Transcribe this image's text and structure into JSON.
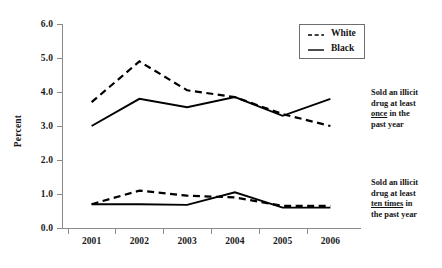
{
  "chart_data": {
    "type": "line",
    "title": "",
    "xlabel": "",
    "ylabel": "Percent",
    "x": [
      "2001",
      "2002",
      "2003",
      "2004",
      "2005",
      "2006"
    ],
    "categories": [
      "2001",
      "2002",
      "2003",
      "2004",
      "2005",
      "2006"
    ],
    "xlim": [
      2000.6,
      2006.4
    ],
    "ylim": [
      0.0,
      6.0
    ],
    "yticks": [
      "0.0",
      "1.0",
      "2.0",
      "3.0",
      "4.0",
      "5.0",
      "6.0"
    ],
    "ytick_values": [
      0.0,
      1.0,
      2.0,
      3.0,
      4.0,
      5.0,
      6.0
    ],
    "grid": false,
    "legend_position": "top-right",
    "legend": [
      {
        "label": "White",
        "style": "dashed"
      },
      {
        "label": "Black",
        "style": "solid"
      }
    ],
    "groups": [
      {
        "name": "Sold an illicit drug at least once in the past year",
        "series": [
          {
            "name": "White",
            "style": "dashed",
            "values": [
              3.7,
              4.9,
              4.05,
              3.85,
              3.35,
              3.0
            ]
          },
          {
            "name": "Black",
            "style": "solid",
            "values": [
              3.0,
              3.8,
              3.55,
              3.85,
              3.3,
              3.8
            ]
          }
        ]
      },
      {
        "name": "Sold an illicit drug at least ten times in the past year",
        "series": [
          {
            "name": "White",
            "style": "dashed",
            "values": [
              0.7,
              1.1,
              0.95,
              0.9,
              0.65,
              0.65
            ]
          },
          {
            "name": "Black",
            "style": "solid",
            "values": [
              0.7,
              0.7,
              0.68,
              1.05,
              0.6,
              0.6
            ]
          }
        ]
      }
    ],
    "series": [
      {
        "name": "White - once in past year",
        "style": "dashed",
        "values": [
          3.7,
          4.9,
          4.05,
          3.85,
          3.35,
          3.0
        ]
      },
      {
        "name": "Black - once in past year",
        "style": "solid",
        "values": [
          3.0,
          3.8,
          3.55,
          3.85,
          3.3,
          3.8
        ]
      },
      {
        "name": "White - ten times in past year",
        "style": "dashed",
        "values": [
          0.7,
          1.1,
          0.95,
          0.9,
          0.65,
          0.65
        ]
      },
      {
        "name": "Black - ten times in past year",
        "style": "solid",
        "values": [
          0.7,
          0.7,
          0.68,
          1.05,
          0.6,
          0.6
        ]
      }
    ],
    "annotations": [
      {
        "id": "once",
        "lines": [
          "Sold an illicit",
          "drug at least",
          "once in the",
          "past year"
        ],
        "underlined_word": "once"
      },
      {
        "id": "ten",
        "lines": [
          "Sold an illicit",
          "drug at least",
          "ten times in",
          "the past year"
        ],
        "underlined_word": "ten times"
      }
    ],
    "colors": {
      "line": "#000000",
      "axis": "#8a8a8a",
      "text": "#141414",
      "background": "#ffffff"
    }
  }
}
